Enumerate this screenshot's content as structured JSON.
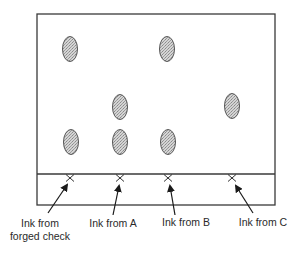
{
  "diagram": {
    "type": "thin-layer-chromatography",
    "plate": {
      "x": 37,
      "y": 14,
      "width": 238,
      "height": 191,
      "baseline_y": 174,
      "stroke": "#3a3a3a"
    },
    "spot_style": {
      "fill": "#c9c9c9",
      "stroke": "#555555",
      "rx": 7.5,
      "ry": 12.5
    },
    "lanes": [
      {
        "id": "forged",
        "x": 70,
        "label_lines": [
          "Ink from",
          "forged check"
        ],
        "label_x": 40,
        "spots": [
          {
            "cx": 70,
            "cy": 49
          },
          {
            "cx": 71,
            "cy": 142
          }
        ],
        "arrow": {
          "x1": 48,
          "y1": 213,
          "x2": 67,
          "y2": 185
        }
      },
      {
        "id": "A",
        "x": 120,
        "label_lines": [
          "Ink from A"
        ],
        "label_x": 113,
        "spots": [
          {
            "cx": 120,
            "cy": 107
          },
          {
            "cx": 120,
            "cy": 142
          }
        ],
        "arrow": {
          "x1": 113,
          "y1": 215,
          "x2": 119,
          "y2": 186
        }
      },
      {
        "id": "B",
        "x": 168,
        "label_lines": [
          "Ink from B"
        ],
        "label_x": 186,
        "spots": [
          {
            "cx": 167,
            "cy": 49
          },
          {
            "cx": 168,
            "cy": 142
          }
        ],
        "arrow": {
          "x1": 175,
          "y1": 215,
          "x2": 170,
          "y2": 186
        }
      },
      {
        "id": "C",
        "x": 232,
        "label_lines": [
          "Ink from C"
        ],
        "label_x": 263,
        "spots": [
          {
            "cx": 232,
            "cy": 106
          }
        ],
        "arrow": {
          "x1": 253,
          "y1": 213,
          "x2": 236,
          "y2": 186
        }
      }
    ],
    "origin_mark_y": 178,
    "origin_mark_glyph": "cross-x-icon"
  },
  "labels": {
    "forged_line1": "Ink from",
    "forged_line2": "forged check",
    "a": "Ink from A",
    "b": "Ink from B",
    "c": "Ink from C"
  }
}
